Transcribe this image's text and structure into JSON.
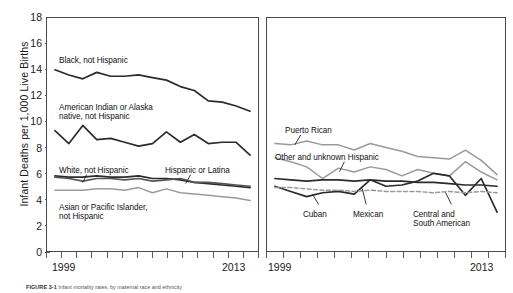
{
  "figure": {
    "ylabel": "Infant Deaths per 1,000 Live Births",
    "caption_number": "FIGURE 3-1",
    "caption_text": "Infant mortality rates, by maternal race and ethnicity"
  },
  "axis": {
    "yticks": [
      "18",
      "16",
      "14",
      "12",
      "10",
      "8",
      "6",
      "4",
      "2",
      "0"
    ],
    "ymin": 0,
    "ymax": 18,
    "xmin": 1999,
    "xmax": 2013,
    "xtick_count": 15
  },
  "panels": [
    {
      "name": "race-panel",
      "xlabel_start": "1999",
      "xlabel_end": "2013",
      "labels": [
        {
          "text": "Black, not Hispanic",
          "x": 12,
          "y": 38
        },
        {
          "text": "American Indian or Alaska\nnative, not Hispanic",
          "x": 12,
          "y": 85
        },
        {
          "text": "White, not Hispanic",
          "x": 12,
          "y": 148
        },
        {
          "text": "Asian or Pacific Islander,\nnot Hispanic",
          "x": 12,
          "y": 185
        },
        {
          "text": "Hispanic or Latina",
          "x": 118,
          "y": 148
        }
      ]
    },
    {
      "name": "hispanic-origin-panel",
      "xlabel_start": "1999",
      "xlabel_end": "2013",
      "labels": [
        {
          "text": "Puerto Rican",
          "x": 18,
          "y": 108
        },
        {
          "text": "Other and unknown Hispanic",
          "x": 8,
          "y": 135
        },
        {
          "text": "Cuban",
          "x": 36,
          "y": 192
        },
        {
          "text": "Mexican",
          "x": 86,
          "y": 192
        },
        {
          "text": "Central and\nSouth American",
          "x": 146,
          "y": 192
        }
      ]
    }
  ],
  "colors": {
    "dark_line": "#2b2b2b",
    "mid_line": "#555555",
    "light_line": "#9a9a9a",
    "frame": "#4a4a4a"
  },
  "chart_data": {
    "type": "line",
    "xlabel": "",
    "ylabel": "Infant Deaths per 1,000 Live Births",
    "x": [
      1999,
      2000,
      2001,
      2002,
      2003,
      2004,
      2005,
      2006,
      2007,
      2008,
      2009,
      2010,
      2011,
      2012,
      2013
    ],
    "xlim": [
      1999,
      2013
    ],
    "ylim": [
      0,
      18
    ],
    "ytick_step": 2,
    "grid": false,
    "legend": "inline-annotations",
    "panels": [
      {
        "name": "Maternal race and ethnicity",
        "series": [
          {
            "name": "Black, not Hispanic",
            "style": "solid-dark",
            "values": [
              14.0,
              13.6,
              13.3,
              13.8,
              13.5,
              13.5,
              13.6,
              13.4,
              13.2,
              12.7,
              12.4,
              11.6,
              11.5,
              11.2,
              10.8
            ]
          },
          {
            "name": "American Indian or Alaska native, not Hispanic",
            "style": "solid-dark",
            "values": [
              9.3,
              8.3,
              9.7,
              8.6,
              8.7,
              8.4,
              8.1,
              8.3,
              9.2,
              8.4,
              9.0,
              8.3,
              8.4,
              8.4,
              7.4
            ]
          },
          {
            "name": "White, not Hispanic",
            "style": "solid-dark",
            "values": [
              5.8,
              5.7,
              5.7,
              5.8,
              5.7,
              5.7,
              5.8,
              5.6,
              5.6,
              5.5,
              5.3,
              5.2,
              5.1,
              5.0,
              4.9
            ]
          },
          {
            "name": "Hispanic or Latina",
            "style": "solid-mid",
            "values": [
              5.7,
              5.6,
              5.4,
              5.6,
              5.6,
              5.5,
              5.6,
              5.4,
              5.5,
              5.6,
              5.3,
              5.3,
              5.2,
              5.1,
              5.0
            ]
          },
          {
            "name": "Asian or Pacific Islander, not Hispanic",
            "style": "solid-light",
            "values": [
              4.7,
              4.7,
              4.7,
              4.8,
              4.8,
              4.7,
              4.9,
              4.5,
              4.8,
              4.5,
              4.4,
              4.3,
              4.2,
              4.1,
              3.9
            ]
          }
        ]
      },
      {
        "name": "Hispanic origin",
        "series": [
          {
            "name": "Puerto Rican",
            "style": "solid-light",
            "values": [
              8.3,
              8.2,
              8.5,
              8.2,
              8.2,
              7.8,
              8.3,
              8.0,
              7.7,
              7.3,
              7.2,
              7.1,
              7.8,
              7.0,
              5.9
            ]
          },
          {
            "name": "Other and unknown Hispanic",
            "style": "solid-light",
            "values": [
              7.2,
              6.9,
              6.5,
              5.6,
              6.4,
              6.1,
              6.5,
              6.3,
              5.8,
              6.3,
              6.0,
              5.8,
              6.9,
              6.1,
              5.5
            ]
          },
          {
            "name": "Cuban",
            "style": "solid-dark",
            "values": [
              5.0,
              4.6,
              4.2,
              4.5,
              4.6,
              4.4,
              5.5,
              5.0,
              5.1,
              5.4,
              6.0,
              5.8,
              4.3,
              5.6,
              3.0
            ]
          },
          {
            "name": "Mexican",
            "style": "solid-dark",
            "values": [
              5.6,
              5.5,
              5.4,
              5.5,
              5.5,
              5.4,
              5.5,
              5.4,
              5.4,
              5.3,
              5.3,
              5.2,
              5.1,
              5.1,
              5.0
            ]
          },
          {
            "name": "Central and South American",
            "style": "dashed-light",
            "values": [
              4.9,
              4.9,
              4.8,
              4.7,
              4.7,
              4.6,
              4.7,
              4.6,
              4.6,
              4.6,
              4.5,
              4.6,
              4.5,
              4.6,
              4.5
            ]
          }
        ]
      }
    ]
  }
}
